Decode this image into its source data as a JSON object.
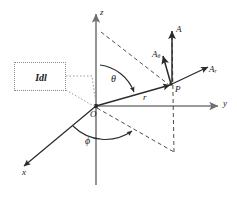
{
  "figure": {
    "type": "spherical-coordinate-vector-diagram",
    "background": "#ffffff",
    "stroke_color": "#2b2b2b",
    "axis_color": "#6f6f6f",
    "dashed_color": "#3a3a3a",
    "callout_color": "#8a8a8a"
  },
  "axes": {
    "z": {
      "label": "z"
    },
    "y": {
      "label": "y"
    },
    "x": {
      "label": "x"
    }
  },
  "origin": {
    "label": "O"
  },
  "point": {
    "label": "P"
  },
  "angles": {
    "theta": {
      "label": "θ"
    },
    "phi": {
      "label": "ϕ"
    }
  },
  "vectors": {
    "radius": {
      "label": "r"
    },
    "a_total": {
      "label": "A",
      "sub": ""
    },
    "a_theta": {
      "label": "A",
      "sub": "θ"
    },
    "a_r": {
      "label": "A",
      "sub": "r"
    }
  },
  "callout": {
    "label": "Idl"
  }
}
